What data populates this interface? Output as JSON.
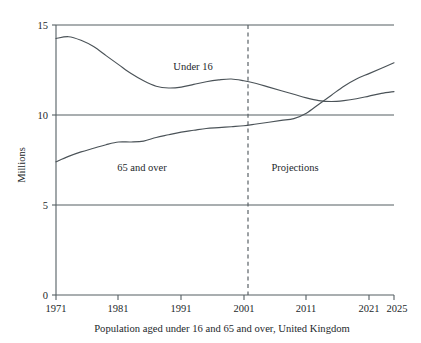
{
  "chart_data": {
    "type": "line",
    "title": "",
    "caption": "Population aged under 16 and 65 and over, United Kingdom",
    "xlabel": "",
    "ylabel": "Millions",
    "xlim": [
      1971,
      2025
    ],
    "ylim": [
      0,
      15
    ],
    "xticks": [
      1971,
      1981,
      1991,
      2001,
      2011,
      2021,
      2025
    ],
    "xtick_labels": [
      "1971",
      "1981",
      "1991",
      "2001",
      "2011",
      "2021",
      "2025"
    ],
    "yticks": [
      0,
      5,
      10,
      15
    ],
    "ytick_labels": [
      "0",
      "5",
      "10",
      "15"
    ],
    "grid": "horizontal-gridlines-at-5-10-15",
    "legend_position": "inline-labels",
    "units": "millions",
    "annotations": [
      {
        "name": "under-16-label",
        "text": "Under 16",
        "x": 1994,
        "y": 12.9
      },
      {
        "name": "65-and-over-label",
        "text": "65 and over",
        "x": 1985,
        "y": 7.1
      },
      {
        "name": "projections-label",
        "text": "Projections",
        "x": 2009,
        "y": 7.1
      }
    ],
    "projection_divider": {
      "name": "projection-divider",
      "x": 2001,
      "style": "dashed",
      "label": "Projections"
    },
    "series": [
      {
        "name": "Under 16",
        "color": "#4b5358",
        "x": [
          1971,
          1973,
          1975,
          1977,
          1979,
          1981,
          1983,
          1985,
          1987,
          1989,
          1991,
          1993,
          1995,
          1997,
          1999,
          2001,
          2003,
          2005,
          2007,
          2009,
          2011,
          2013,
          2015,
          2017,
          2019,
          2021,
          2023,
          2025
        ],
        "values": [
          14.25,
          14.35,
          14.15,
          13.8,
          13.3,
          12.8,
          12.3,
          11.9,
          11.6,
          11.5,
          11.55,
          11.7,
          11.85,
          11.95,
          12.0,
          11.9,
          11.75,
          11.55,
          11.35,
          11.15,
          10.95,
          10.8,
          10.75,
          10.8,
          10.9,
          11.05,
          11.2,
          11.3
        ]
      },
      {
        "name": "65 and over",
        "color": "#4b5358",
        "x": [
          1971,
          1973,
          1975,
          1977,
          1979,
          1981,
          1983,
          1985,
          1987,
          1989,
          1991,
          1993,
          1995,
          1997,
          1999,
          2001,
          2003,
          2005,
          2007,
          2009,
          2011,
          2013,
          2015,
          2017,
          2019,
          2021,
          2023,
          2025
        ],
        "values": [
          7.4,
          7.7,
          7.95,
          8.15,
          8.35,
          8.5,
          8.5,
          8.55,
          8.75,
          8.9,
          9.05,
          9.15,
          9.25,
          9.3,
          9.35,
          9.4,
          9.5,
          9.6,
          9.7,
          9.8,
          10.1,
          10.6,
          11.1,
          11.6,
          12.0,
          12.3,
          12.6,
          12.9
        ]
      }
    ]
  },
  "axis": {
    "y_label": "Millions",
    "y_tick_0": "0",
    "y_tick_5": "5",
    "y_tick_10": "10",
    "y_tick_15": "15",
    "x_tick_1971": "1971",
    "x_tick_1981": "1981",
    "x_tick_1991": "1991",
    "x_tick_2001": "2001",
    "x_tick_2011": "2011",
    "x_tick_2021": "2021",
    "x_tick_2025": "2025"
  },
  "labels": {
    "under16": "Under 16",
    "over65": "65 and over",
    "projections": "Projections"
  },
  "caption": "Population aged under 16 and 65 and over, United Kingdom",
  "colors": {
    "line": "#4b5358",
    "grid": "#555f63",
    "text": "#23282b",
    "background": "#ffffff"
  }
}
